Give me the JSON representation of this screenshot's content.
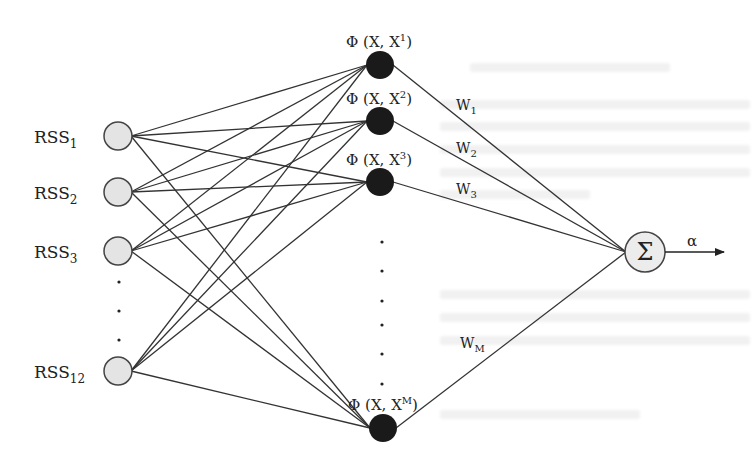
{
  "diagram": {
    "type": "rbf-neural-network",
    "colors": {
      "line": "#333333",
      "input_fill": "#e4e4e4",
      "input_stroke": "#444444",
      "hidden_fill": "#1a1a1a",
      "output_fill": "#ececec",
      "output_stroke": "#444444"
    },
    "input_layer": {
      "nodes": [
        {
          "label": "RSS",
          "sub": "1",
          "cx": 118,
          "cy": 136
        },
        {
          "label": "RSS",
          "sub": "2",
          "cx": 118,
          "cy": 192
        },
        {
          "label": "RSS",
          "sub": "3",
          "cx": 118,
          "cy": 251
        },
        {
          "label": "RSS",
          "sub": "12",
          "cx": 118,
          "cy": 371
        }
      ],
      "ellipsis_dots_y": [
        282,
        311,
        340
      ],
      "radius": 14
    },
    "hidden_layer": {
      "nodes": [
        {
          "label": "Φ (X, X",
          "sup": "1",
          "close": ")",
          "cx": 380,
          "cy": 65,
          "lx": 346,
          "ly": 47
        },
        {
          "label": "Φ (X, X",
          "sup": "2",
          "close": ")",
          "cx": 380,
          "cy": 121,
          "lx": 346,
          "ly": 104
        },
        {
          "label": "Φ (X, X",
          "sup": "3",
          "close": ")",
          "cx": 380,
          "cy": 182,
          "lx": 346,
          "ly": 165
        },
        {
          "label": "Φ (X, X",
          "sup": "M",
          "close": ")",
          "cx": 383,
          "cy": 428,
          "lx": 348,
          "ly": 410
        }
      ],
      "ellipsis_dots_y": [
        242,
        271,
        301,
        325,
        354,
        384
      ],
      "radius": 14
    },
    "weights": [
      {
        "label": "W",
        "sub": "1",
        "x": 456,
        "y": 110
      },
      {
        "label": "W",
        "sub": "2",
        "x": 456,
        "y": 153
      },
      {
        "label": "W",
        "sub": "3",
        "x": 456,
        "y": 194
      },
      {
        "label": "W",
        "sub": "M",
        "x": 460,
        "y": 348
      }
    ],
    "output_node": {
      "symbol": "Σ",
      "cx": 645,
      "cy": 252,
      "radius": 20
    },
    "output_arrow": {
      "label": "α",
      "x1": 665,
      "x2": 724,
      "y": 252
    }
  }
}
